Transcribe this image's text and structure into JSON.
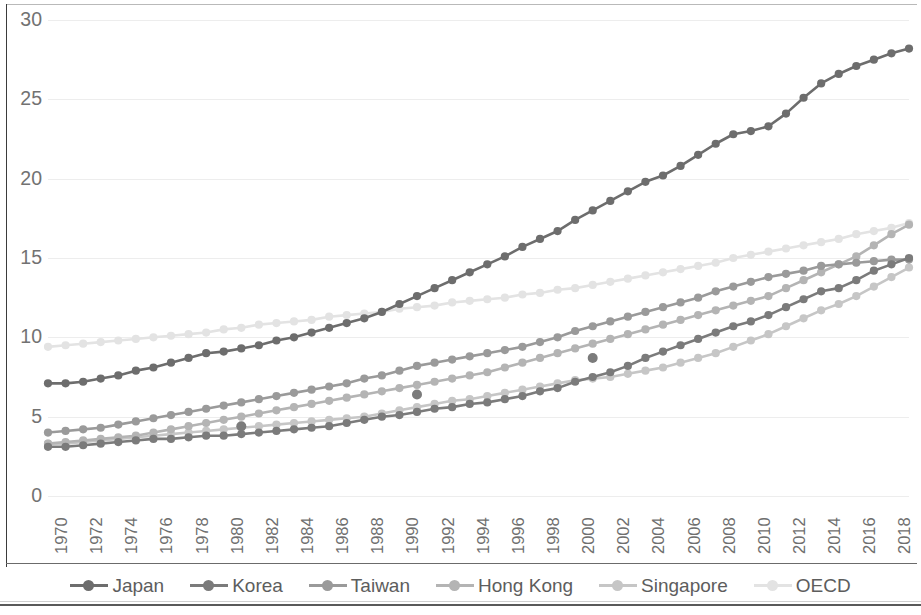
{
  "chart_data": {
    "type": "line",
    "title": "",
    "xlabel": "",
    "ylabel": "",
    "ylim": [
      0,
      30
    ],
    "yticks": [
      0,
      5,
      10,
      15,
      20,
      25,
      30
    ],
    "xlim": [
      1970,
      2019
    ],
    "grid": true,
    "legend_position": "bottom",
    "markers": "circle",
    "x": [
      1970,
      1971,
      1972,
      1973,
      1974,
      1975,
      1976,
      1977,
      1978,
      1979,
      1980,
      1981,
      1982,
      1983,
      1984,
      1985,
      1986,
      1987,
      1988,
      1989,
      1990,
      1991,
      1992,
      1993,
      1994,
      1995,
      1996,
      1997,
      1998,
      1999,
      2000,
      2001,
      2002,
      2003,
      2004,
      2005,
      2006,
      2007,
      2008,
      2009,
      2010,
      2011,
      2012,
      2013,
      2014,
      2015,
      2016,
      2017,
      2018,
      2019
    ],
    "xtick_labels": [
      "1970",
      "1972",
      "1974",
      "1976",
      "1978",
      "1980",
      "1982",
      "1984",
      "1986",
      "1988",
      "1990",
      "1992",
      "1994",
      "1996",
      "1998",
      "2000",
      "2002",
      "2004",
      "2006",
      "2008",
      "2010",
      "2012",
      "2014",
      "2016",
      "2018"
    ],
    "series": [
      {
        "name": "Japan",
        "color": "#6d6d6d",
        "values": [
          7.1,
          7.1,
          7.2,
          7.4,
          7.6,
          7.9,
          8.1,
          8.4,
          8.7,
          9.0,
          9.1,
          9.3,
          9.5,
          9.8,
          10.0,
          10.3,
          10.6,
          10.9,
          11.2,
          11.6,
          12.1,
          12.6,
          13.1,
          13.6,
          14.1,
          14.6,
          15.1,
          15.7,
          16.2,
          16.7,
          17.4,
          18.0,
          18.6,
          19.2,
          19.8,
          20.2,
          20.8,
          21.5,
          22.2,
          22.8,
          23.0,
          23.3,
          24.1,
          25.1,
          26.0,
          26.6,
          27.1,
          27.5,
          27.9,
          28.2
        ]
      },
      {
        "name": "Korea",
        "color": "#7b7b7b",
        "values": [
          3.1,
          3.1,
          3.2,
          3.3,
          3.4,
          3.5,
          3.6,
          3.6,
          3.7,
          3.8,
          3.8,
          3.9,
          4.0,
          4.1,
          4.2,
          4.3,
          4.4,
          4.6,
          4.8,
          5.0,
          5.1,
          5.3,
          5.5,
          5.6,
          5.8,
          5.9,
          6.1,
          6.3,
          6.6,
          6.8,
          7.2,
          7.5,
          7.8,
          8.2,
          8.7,
          9.1,
          9.5,
          9.9,
          10.3,
          10.7,
          11.0,
          11.4,
          11.9,
          12.4,
          12.9,
          13.1,
          13.6,
          14.2,
          14.6,
          15.0
        ]
      },
      {
        "name": "Taiwan",
        "color": "#9a9a9a",
        "values": [
          4.0,
          4.1,
          4.2,
          4.3,
          4.5,
          4.7,
          4.9,
          5.1,
          5.3,
          5.5,
          5.7,
          5.9,
          6.1,
          6.3,
          6.5,
          6.7,
          6.9,
          7.1,
          7.4,
          7.6,
          7.9,
          8.2,
          8.4,
          8.6,
          8.8,
          9.0,
          9.2,
          9.4,
          9.7,
          10.0,
          10.4,
          10.7,
          11.0,
          11.3,
          11.6,
          11.9,
          12.2,
          12.5,
          12.9,
          13.2,
          13.5,
          13.8,
          14.0,
          14.2,
          14.5,
          14.6,
          14.7,
          14.8,
          14.9,
          14.9
        ]
      },
      {
        "name": "Hong Kong",
        "color": "#b4b4b4",
        "values": [
          3.3,
          3.4,
          3.5,
          3.6,
          3.7,
          3.8,
          4.0,
          4.2,
          4.4,
          4.6,
          4.8,
          5.0,
          5.2,
          5.4,
          5.6,
          5.8,
          6.0,
          6.2,
          6.4,
          6.6,
          6.8,
          7.0,
          7.2,
          7.4,
          7.6,
          7.8,
          8.1,
          8.4,
          8.7,
          9.0,
          9.3,
          9.6,
          9.9,
          10.2,
          10.5,
          10.8,
          11.1,
          11.4,
          11.7,
          12.0,
          12.3,
          12.6,
          13.1,
          13.6,
          14.1,
          14.6,
          15.1,
          15.8,
          16.5,
          17.1
        ]
      },
      {
        "name": "Singapore",
        "color": "#c6c6c6",
        "values": [
          3.3,
          3.3,
          3.4,
          3.5,
          3.6,
          3.7,
          3.8,
          3.9,
          4.0,
          4.1,
          4.2,
          4.3,
          4.4,
          4.5,
          4.6,
          4.7,
          4.8,
          4.9,
          5.0,
          5.2,
          5.4,
          5.6,
          5.8,
          6.0,
          6.1,
          6.3,
          6.5,
          6.7,
          6.9,
          7.1,
          7.3,
          7.4,
          7.5,
          7.7,
          7.9,
          8.1,
          8.4,
          8.7,
          9.0,
          9.4,
          9.8,
          10.2,
          10.7,
          11.2,
          11.7,
          12.1,
          12.6,
          13.2,
          13.8,
          14.4
        ]
      },
      {
        "name": "OECD",
        "color": "#e3e3e3",
        "values": [
          9.4,
          9.5,
          9.6,
          9.7,
          9.8,
          9.9,
          10.0,
          10.1,
          10.2,
          10.3,
          10.5,
          10.6,
          10.8,
          10.9,
          11.0,
          11.1,
          11.3,
          11.4,
          11.5,
          11.6,
          11.8,
          11.9,
          12.0,
          12.2,
          12.3,
          12.4,
          12.5,
          12.7,
          12.8,
          13.0,
          13.1,
          13.3,
          13.5,
          13.7,
          13.9,
          14.1,
          14.3,
          14.5,
          14.7,
          15.0,
          15.2,
          15.4,
          15.6,
          15.8,
          16.0,
          16.2,
          16.5,
          16.7,
          16.9,
          17.2
        ]
      }
    ],
    "outlier_points": [
      {
        "series": "Korea",
        "x": 1981,
        "y": 4.4,
        "color": "#7b7b7b"
      },
      {
        "series": "Korea",
        "x": 1991,
        "y": 6.4,
        "color": "#7b7b7b"
      },
      {
        "series": "Korea",
        "x": 2001,
        "y": 8.7,
        "color": "#7b7b7b"
      }
    ]
  },
  "legend": {
    "items": [
      {
        "label": "Japan"
      },
      {
        "label": "Korea"
      },
      {
        "label": "Taiwan"
      },
      {
        "label": "Hong Kong"
      },
      {
        "label": "Singapore"
      },
      {
        "label": "OECD"
      }
    ]
  }
}
